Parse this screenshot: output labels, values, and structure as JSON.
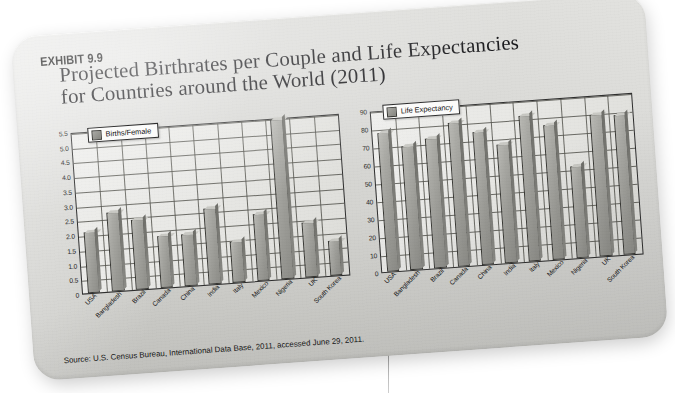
{
  "exhibit": {
    "label": "EXHIBIT 9.9",
    "title_line_1": "Projected Birthrates per Couple and Life Expectancies",
    "title_line_2": "for Countries around the World (2011)",
    "source": "Source: U.S. Census Bureau, International Data Base, 2011, accessed June 29, 2011.",
    "source_prefix": "Source:",
    "card_color": "#d8d8d5",
    "bar_color": "#9b9b96",
    "axis_color": "#2f2f2f"
  },
  "chart_data": [
    {
      "type": "bar",
      "id": "births",
      "title": "",
      "legend": "Births/Female",
      "legend_position": "top-left",
      "xlabel": "",
      "ylabel": "",
      "grid": true,
      "ylim": [
        0,
        5.5
      ],
      "yticks": [
        0,
        0.5,
        1.0,
        1.5,
        2.0,
        2.5,
        3.0,
        3.5,
        4.0,
        4.5,
        5.0,
        5.5
      ],
      "ytick_labels": [
        "0",
        "0.5",
        "1.0",
        "1.5",
        "2.0",
        "2.5",
        "3.0",
        "3.5",
        "4.0",
        "4.5",
        "5.0",
        "5.5"
      ],
      "categories": [
        "USA",
        "Bangladesh",
        "Brazil",
        "Canada",
        "China",
        "India",
        "Italy",
        "Mexico",
        "Nigeria",
        "UK",
        "South Korea"
      ],
      "values": [
        2.1,
        2.7,
        2.4,
        1.8,
        1.8,
        2.6,
        1.4,
        2.3,
        5.5,
        1.9,
        1.2
      ]
    },
    {
      "type": "bar",
      "id": "life",
      "title": "",
      "legend": "Life Expectancy",
      "legend_position": "top-left",
      "xlabel": "",
      "ylabel": "",
      "grid": true,
      "ylim": [
        0,
        90
      ],
      "yticks": [
        0,
        10,
        20,
        30,
        40,
        50,
        60,
        70,
        80,
        90
      ],
      "ytick_labels": [
        "0",
        "10",
        "20",
        "30",
        "40",
        "50",
        "60",
        "70",
        "80",
        "90"
      ],
      "categories": [
        "USA",
        "Bangladesh",
        "Brazil",
        "Canada",
        "China",
        "India",
        "Italy",
        "Mexico",
        "Nigeria",
        "UK",
        "South Korea"
      ],
      "values": [
        78,
        70,
        73,
        81,
        75,
        67,
        82,
        76,
        52,
        80,
        79
      ]
    }
  ]
}
